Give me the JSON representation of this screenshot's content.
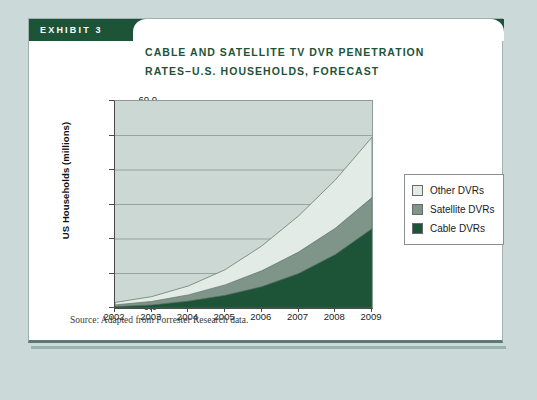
{
  "exhibit": {
    "tab_label": "EXHIBIT 3",
    "title_line1": "CABLE AND SATELLITE TV DVR PENETRATION",
    "title_line2": "RATES–U.S. HOUSEHOLDS, FORECAST",
    "source": "Source: Adapted from Forrester Research data."
  },
  "colors": {
    "brand_green": "#1d5438",
    "page_background": "#ccd9d9",
    "card_background": "#ffffff",
    "plot_background": "#cbd8d3",
    "cable_dvrs": "#1d5438",
    "satellite_dvrs": "#7f958a",
    "other_dvrs": "#e3ebe6",
    "gridline": "#8fa09c",
    "axis": "#4a4a4a"
  },
  "legend": {
    "position": "right",
    "items": [
      {
        "label": "Other DVRs",
        "color": "#e3ebe6"
      },
      {
        "label": "Satellite DVRs",
        "color": "#7f958a"
      },
      {
        "label": "Cable DVRs",
        "color": "#1d5438"
      }
    ]
  },
  "chart_data": {
    "type": "area",
    "stacked": true,
    "title": "CABLE AND SATELLITE TV DVR PENETRATION RATES–U.S. HOUSEHOLDS, FORECAST",
    "xlabel": "",
    "ylabel": "US Households (millions)",
    "categories": [
      "2002",
      "2003",
      "2004",
      "2005",
      "2006",
      "2007",
      "2008",
      "2009"
    ],
    "x": [
      2002,
      2003,
      2004,
      2005,
      2006,
      2007,
      2008,
      2009
    ],
    "ylim": [
      0.0,
      60.0
    ],
    "yticks": [
      "0.0",
      "10.0",
      "20.0",
      "30.0",
      "40.0",
      "50.0",
      "60.0"
    ],
    "ytick_values": [
      0.0,
      10.0,
      20.0,
      30.0,
      40.0,
      50.0,
      60.0
    ],
    "xlim": [
      2002,
      2009
    ],
    "grid": true,
    "grid_axis": "y",
    "legend_position": "right-outside",
    "series": [
      {
        "name": "Cable DVRs",
        "color": "#1d5438",
        "values": [
          0.4,
          0.9,
          2.0,
          3.7,
          6.2,
          10.0,
          15.5,
          23.0
        ]
      },
      {
        "name": "Satellite DVRs",
        "color": "#7f958a",
        "values": [
          0.5,
          1.0,
          1.8,
          3.0,
          4.6,
          6.2,
          7.6,
          9.0
        ]
      },
      {
        "name": "Other DVRs",
        "color": "#e3ebe6",
        "values": [
          0.7,
          1.4,
          2.6,
          4.4,
          7.2,
          10.5,
          14.0,
          17.5
        ]
      }
    ],
    "totals": [
      1.6,
      3.3,
      6.4,
      11.1,
      18.0,
      26.7,
      37.1,
      49.5
    ]
  }
}
